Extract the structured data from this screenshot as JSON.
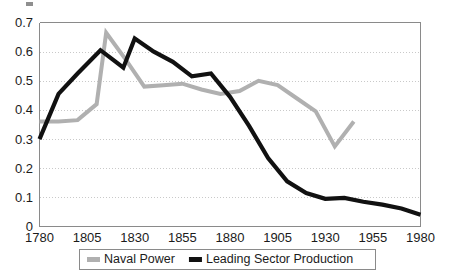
{
  "chart_data": {
    "type": "line",
    "title": "",
    "subtitle": "",
    "xlabel": "",
    "ylabel": "",
    "xlim": [
      1780,
      1980
    ],
    "ylim": [
      0,
      0.7
    ],
    "grid": true,
    "grid_axis": "y",
    "legend_position": "bottom",
    "x_ticks": [
      1780,
      1805,
      1830,
      1855,
      1880,
      1905,
      1930,
      1955,
      1980
    ],
    "x_tick_labels": [
      "1780",
      "1805",
      "1830",
      "1855",
      "1880",
      "1905",
      "1930",
      "1955",
      "1980"
    ],
    "y_ticks": [
      0,
      0.1,
      0.2,
      0.3,
      0.4,
      0.5,
      0.6,
      0.7
    ],
    "y_tick_labels": [
      "0",
      "0.1",
      "0.2",
      "0.3",
      "0.4",
      "0.5",
      "0.6",
      "0.7"
    ],
    "series": [
      {
        "name": "Naval Power",
        "color": "#b0b0b0",
        "stroke_width": 4.0,
        "x": [
          1780,
          1790,
          1800,
          1810,
          1815,
          1825,
          1835,
          1845,
          1855,
          1865,
          1875,
          1885,
          1895,
          1905,
          1915,
          1925,
          1935,
          1945
        ],
        "values": [
          0.36,
          0.36,
          0.365,
          0.42,
          0.665,
          0.575,
          0.48,
          0.485,
          0.49,
          0.47,
          0.455,
          0.465,
          0.5,
          0.485,
          0.44,
          0.395,
          0.275,
          0.36
        ]
      },
      {
        "name": "Leading Sector Production",
        "color": "#111111",
        "stroke_width": 4.2,
        "x": [
          1780,
          1790,
          1800,
          1812,
          1818,
          1824,
          1830,
          1840,
          1850,
          1860,
          1870,
          1880,
          1890,
          1900,
          1910,
          1920,
          1930,
          1940,
          1950,
          1960,
          1970,
          1980
        ],
        "values": [
          0.3,
          0.455,
          0.525,
          0.605,
          0.575,
          0.545,
          0.645,
          0.6,
          0.565,
          0.515,
          0.525,
          0.445,
          0.345,
          0.235,
          0.155,
          0.115,
          0.095,
          0.098,
          0.085,
          0.075,
          0.062,
          0.04
        ]
      }
    ]
  },
  "legend": {
    "items": [
      {
        "label": "Naval Power",
        "color": "#b0b0b0"
      },
      {
        "label": "Leading Sector Production",
        "color": "#111111"
      }
    ]
  }
}
